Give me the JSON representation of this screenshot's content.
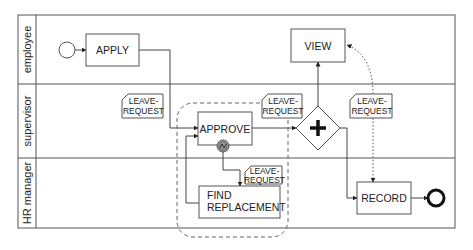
{
  "diagram": {
    "type": "BPMN process",
    "pool": {
      "x": 18,
      "y": 15,
      "width": 437,
      "height": 213,
      "header_width": 18,
      "lanes": [
        {
          "id": "employee",
          "label": "employee",
          "y": 15,
          "height": 69
        },
        {
          "id": "supervisor",
          "label": "supervisor",
          "y": 84,
          "height": 74
        },
        {
          "id": "hr",
          "label": "HR manager",
          "y": 158,
          "height": 70
        }
      ]
    },
    "events": {
      "start": {
        "name": "start-event",
        "cx": 67,
        "cy": 50,
        "r": 8
      },
      "end": {
        "name": "end-event",
        "cx": 436,
        "cy": 198,
        "r": 8
      },
      "boundary": {
        "name": "error-boundary-event",
        "cx": 223,
        "cy": 146,
        "r": 6,
        "fill": "#9a9a9a"
      }
    },
    "tasks": [
      {
        "id": "apply",
        "label_lines": [
          "APPLY"
        ],
        "x": 86,
        "y": 34,
        "w": 53,
        "h": 32
      },
      {
        "id": "approve",
        "label_lines": [
          "APPROVE"
        ],
        "x": 198,
        "y": 112,
        "w": 54,
        "h": 33
      },
      {
        "id": "find_replacement",
        "label_lines": [
          "FIND",
          "REPLACEMENT"
        ],
        "x": 199,
        "y": 186,
        "w": 81,
        "h": 32
      },
      {
        "id": "view",
        "label_lines": [
          "VIEW"
        ],
        "x": 291,
        "y": 29,
        "w": 54,
        "h": 33
      },
      {
        "id": "record",
        "label_lines": [
          "RECORD"
        ],
        "x": 357,
        "y": 182,
        "w": 54,
        "h": 32
      }
    ],
    "gateway": {
      "name": "parallel-gateway",
      "cx": 318,
      "cy": 128,
      "half": 22,
      "symbol": "+"
    },
    "data_objects": [
      {
        "id": "do1",
        "lines": [
          "LEAVE-",
          "REQUEST"
        ],
        "x": 122,
        "y": 94,
        "w": 41,
        "h": 24
      },
      {
        "id": "do2",
        "lines": [
          "LEAVE-",
          "REQUEST"
        ],
        "x": 262,
        "y": 94,
        "w": 40,
        "h": 24
      },
      {
        "id": "do3",
        "lines": [
          "LEAVE-",
          "REQUEST"
        ],
        "x": 245,
        "y": 166,
        "w": 37,
        "h": 18
      },
      {
        "id": "do4",
        "lines": [
          "LEAVE-",
          "REQUEST"
        ],
        "x": 350,
        "y": 94,
        "w": 42,
        "h": 24
      }
    ],
    "subprocess": {
      "name": "approval-subprocess",
      "x": 177,
      "y": 103,
      "w": 111,
      "h": 134,
      "rx": 16,
      "style": "dashed"
    },
    "flows": [
      {
        "name": "start-to-apply",
        "points": [
          [
            75,
            50
          ],
          [
            86,
            50
          ]
        ],
        "style": "solid"
      },
      {
        "name": "apply-to-approve",
        "points": [
          [
            139,
            50
          ],
          [
            170,
            50
          ],
          [
            170,
            128
          ],
          [
            198,
            128
          ]
        ],
        "style": "solid"
      },
      {
        "name": "approve-to-gateway",
        "points": [
          [
            252,
            128
          ],
          [
            296,
            128
          ]
        ],
        "style": "solid"
      },
      {
        "name": "gateway-to-view",
        "points": [
          [
            318,
            106
          ],
          [
            318,
            62
          ]
        ],
        "style": "solid"
      },
      {
        "name": "gateway-to-record",
        "points": [
          [
            340,
            128
          ],
          [
            347,
            128
          ],
          [
            347,
            198
          ],
          [
            357,
            198
          ]
        ],
        "style": "solid"
      },
      {
        "name": "record-to-end",
        "points": [
          [
            411,
            198
          ],
          [
            428,
            198
          ]
        ],
        "style": "solid"
      },
      {
        "name": "boundary-to-find",
        "points": [
          [
            223,
            152
          ],
          [
            223,
            170
          ],
          [
            240,
            170
          ],
          [
            240,
            186
          ]
        ],
        "style": "solid"
      },
      {
        "name": "find-to-approve",
        "points": [
          [
            199,
            203
          ],
          [
            186,
            203
          ],
          [
            186,
            136
          ],
          [
            198,
            136
          ]
        ],
        "style": "solid"
      }
    ],
    "associations": [
      {
        "name": "data-to-view",
        "path": "M373,94 C373,70 365,52 347,45",
        "arrow_at": [
          347,
          45
        ]
      },
      {
        "name": "data-to-record",
        "path": "M373,118 C373,140 373,160 373,182",
        "arrow_at": [
          373,
          182
        ]
      }
    ]
  }
}
